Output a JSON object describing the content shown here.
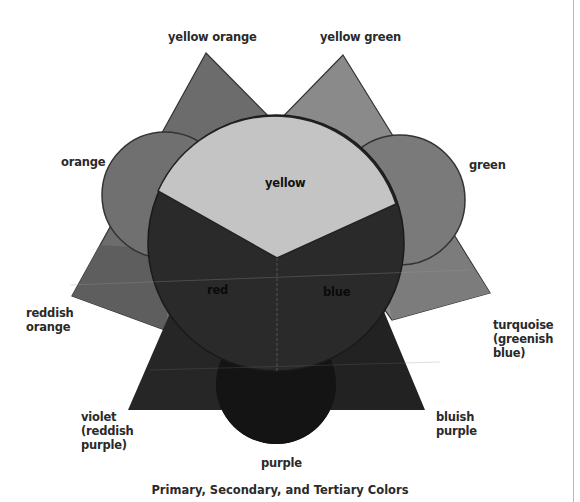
{
  "figure": {
    "caption": "Primary, Secondary, and Tertiary Colors",
    "primary": [
      {
        "name": "yellow",
        "label": "yellow",
        "fill": "#c4c4c4"
      },
      {
        "name": "red",
        "label": "red",
        "fill": "#2a2a2a"
      },
      {
        "name": "blue",
        "label": "blue",
        "fill": "#2c2c2c"
      }
    ],
    "secondary": [
      {
        "name": "orange",
        "label": "orange",
        "fill": "#707070"
      },
      {
        "name": "green",
        "label": "green",
        "fill": "#7a7a7a"
      },
      {
        "name": "purple",
        "label": "purple",
        "fill": "#141414"
      }
    ],
    "tertiary": [
      {
        "name": "yellow-orange",
        "label": "yellow orange",
        "fill": "#6c6c6c"
      },
      {
        "name": "yellow-green",
        "label": "yellow green",
        "fill": "#8a8a8a"
      },
      {
        "name": "reddish-orange",
        "label": "reddish\norange",
        "fill": "#5e5e5e"
      },
      {
        "name": "turquoise",
        "label": "turquoise\n(greenish\nblue)",
        "fill": "#7c7c7c"
      },
      {
        "name": "violet",
        "label": "violet\n(reddish\npurple)",
        "fill": "#262626"
      },
      {
        "name": "bluish-purple",
        "label": "bluish\npurple",
        "fill": "#222222"
      }
    ]
  }
}
